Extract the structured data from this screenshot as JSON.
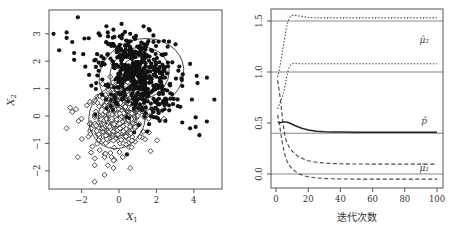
{
  "chart_data": [
    {
      "type": "scatter",
      "title": "",
      "xlabel": "X1",
      "ylabel": "X2",
      "xlim": [
        -3.7,
        5.5
      ],
      "ylim": [
        -2.6,
        3.9
      ],
      "xticks": [
        "-2",
        "0",
        "2",
        "4"
      ],
      "xtick_values": [
        -2,
        0,
        2,
        4
      ],
      "yticks": [
        "-2",
        "-1",
        "0",
        "1",
        "2",
        "3"
      ],
      "ytick_values": [
        -2,
        -1,
        0,
        1,
        2,
        3
      ],
      "grid": false,
      "legend": "none",
      "series": [
        {
          "name": "class 2 (filled circles)",
          "marker": "filled-circle",
          "mean": [
            1.0,
            1.5
          ],
          "sd": [
            1.0,
            0.75
          ],
          "n": 520,
          "outliers": [
            [
              -3.5,
              3.0
            ],
            [
              -3.2,
              2.4
            ],
            [
              -2.8,
              3.05
            ],
            [
              -2.8,
              2.85
            ],
            [
              -2.2,
              3.6
            ],
            [
              -2.4,
              2.05
            ],
            [
              -2.5,
              2.7
            ],
            [
              -2.4,
              2.3
            ],
            [
              -1.6,
              1.5
            ],
            [
              -1.8,
              1.8
            ],
            [
              -0.3,
              3.15
            ],
            [
              -0.6,
              3.05
            ],
            [
              0.6,
              3.0
            ],
            [
              3.8,
              1.9
            ],
            [
              3.8,
              -0.45
            ],
            [
              4.1,
              -0.4
            ],
            [
              4.3,
              -0.7
            ],
            [
              4.1,
              -0.05
            ],
            [
              4.7,
              -0.2
            ],
            [
              5.1,
              0.6
            ],
            [
              4.7,
              1.4
            ],
            [
              4.2,
              1.2
            ],
            [
              3.9,
              0.6
            ]
          ]
        },
        {
          "name": "class 1 (open diamonds)",
          "marker": "open-diamond",
          "mean": [
            0.0,
            0.0
          ],
          "sd": [
            0.75,
            0.6
          ],
          "n": 420,
          "outliers": [
            [
              -2.8,
              -0.45
            ],
            [
              -2.5,
              0.15
            ],
            [
              -2.2,
              -1.5
            ],
            [
              -1.3,
              -2.4
            ],
            [
              -1.3,
              -1.8
            ],
            [
              -1.3,
              -1.55
            ],
            [
              -0.6,
              -1.8
            ],
            [
              -0.3,
              -1.9
            ],
            [
              -0.4,
              -1.5
            ],
            [
              0.2,
              -1.5
            ],
            [
              0.6,
              -1.9
            ],
            [
              1.6,
              -0.6
            ],
            [
              2.4,
              -0.1
            ],
            [
              1.4,
              -0.85
            ],
            [
              -2.3,
              0.25
            ],
            [
              -2.0,
              -0.1
            ]
          ]
        }
      ],
      "contours": [
        {
          "center": [
            1.2,
            1.5
          ],
          "rx": 2.3,
          "ry": 1.3,
          "rotate_deg": -18
        },
        {
          "center": [
            1.1,
            1.55
          ],
          "rx": 1.6,
          "ry": 0.95,
          "rotate_deg": -18
        },
        {
          "center": [
            1.0,
            1.6
          ],
          "rx": 0.9,
          "ry": 0.55,
          "rotate_deg": -18
        },
        {
          "center": [
            -0.1,
            -0.05
          ],
          "rx": 1.5,
          "ry": 1.15,
          "rotate_deg": 15
        },
        {
          "center": [
            -0.1,
            0.0
          ],
          "rx": 1.0,
          "ry": 0.75,
          "rotate_deg": 15
        },
        {
          "center": [
            -0.1,
            0.0
          ],
          "rx": 0.5,
          "ry": 0.4,
          "rotate_deg": 15
        }
      ]
    },
    {
      "type": "line",
      "title": "",
      "xlabel": "迭代次数",
      "ylabel": "",
      "xlim": [
        -3,
        103
      ],
      "ylim": [
        -0.13,
        1.62
      ],
      "xticks": [
        "0",
        "20",
        "40",
        "60",
        "80",
        "100"
      ],
      "xtick_values": [
        0,
        20,
        40,
        60,
        80,
        100
      ],
      "yticks": [
        "0.0",
        "0.5",
        "1.0",
        "1.5"
      ],
      "ytick_values": [
        0.0,
        0.5,
        1.0,
        1.5
      ],
      "grid": false,
      "legend": "inline-labels",
      "reference_lines": [
        1.5,
        1.0,
        0.4,
        0.0
      ],
      "x": [
        1,
        2,
        3,
        4,
        5,
        6,
        7,
        8,
        9,
        10,
        12,
        14,
        16,
        18,
        20,
        25,
        30,
        35,
        40,
        50,
        60,
        70,
        80,
        90,
        100
      ],
      "series": [
        {
          "name": "mu2_hat_component_a",
          "style": "dotted",
          "values": [
            0.95,
            1.02,
            1.1,
            1.2,
            1.3,
            1.4,
            1.47,
            1.52,
            1.545,
            1.555,
            1.555,
            1.55,
            1.545,
            1.54,
            1.535,
            1.53,
            1.53,
            1.53,
            1.53,
            1.53,
            1.53,
            1.53,
            1.53,
            1.53,
            1.53
          ]
        },
        {
          "name": "mu2_hat_component_b",
          "style": "dotted",
          "values": [
            0.64,
            0.68,
            0.72,
            0.76,
            0.82,
            0.9,
            0.98,
            1.04,
            1.07,
            1.08,
            1.085,
            1.08,
            1.08,
            1.08,
            1.08,
            1.08,
            1.08,
            1.08,
            1.08,
            1.08,
            1.08,
            1.08,
            1.08,
            1.08,
            1.08
          ]
        },
        {
          "name": "p_hat",
          "style": "solid",
          "values": [
            0.505,
            0.505,
            0.505,
            0.508,
            0.51,
            0.51,
            0.508,
            0.502,
            0.495,
            0.488,
            0.474,
            0.461,
            0.449,
            0.44,
            0.432,
            0.42,
            0.414,
            0.412,
            0.411,
            0.41,
            0.41,
            0.41,
            0.41,
            0.41,
            0.41
          ]
        },
        {
          "name": "mu1_hat_component_a",
          "style": "dashed",
          "values": [
            0.92,
            0.82,
            0.7,
            0.55,
            0.42,
            0.34,
            0.3,
            0.27,
            0.245,
            0.225,
            0.195,
            0.17,
            0.155,
            0.14,
            0.13,
            0.115,
            0.107,
            0.103,
            0.1,
            0.098,
            0.097,
            0.097,
            0.097,
            0.097,
            0.097
          ]
        },
        {
          "name": "mu1_hat_component_b",
          "style": "dashed",
          "values": [
            0.58,
            0.5,
            0.4,
            0.3,
            0.22,
            0.16,
            0.12,
            0.09,
            0.07,
            0.05,
            0.025,
            0.005,
            -0.01,
            -0.02,
            -0.027,
            -0.038,
            -0.044,
            -0.047,
            -0.049,
            -0.05,
            -0.05,
            -0.05,
            -0.05,
            -0.05,
            -0.05
          ]
        }
      ],
      "annotations": [
        {
          "text": "μ̂₂",
          "x": 92,
          "y": 1.28
        },
        {
          "text": "p̂",
          "x": 92,
          "y": 0.49
        },
        {
          "text": "μ̂₁",
          "x": 92,
          "y": 0.03
        }
      ]
    }
  ]
}
